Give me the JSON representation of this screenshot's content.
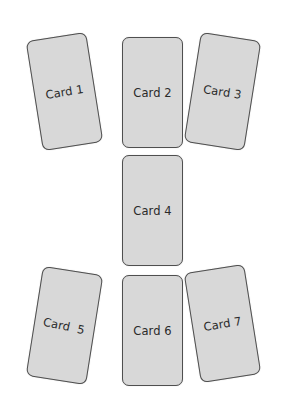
{
  "diagram": {
    "type": "card-layout",
    "cards": [
      {
        "id": 1,
        "label": "Card 1",
        "rotation_deg": -9
      },
      {
        "id": 2,
        "label": "Card 2",
        "rotation_deg": 0
      },
      {
        "id": 3,
        "label": "Card 3",
        "rotation_deg": 9
      },
      {
        "id": 4,
        "label": "Card 4",
        "rotation_deg": 0
      },
      {
        "id": 5,
        "label": "Card  5",
        "rotation_deg": 9
      },
      {
        "id": 6,
        "label": "Card 6",
        "rotation_deg": 0
      },
      {
        "id": 7,
        "label": "Card 7",
        "rotation_deg": -9
      }
    ],
    "colors": {
      "card_fill": "#d8d8d8",
      "card_border": "#4f4f4f",
      "label": "#2a2a2a",
      "background": "#ffffff"
    }
  }
}
